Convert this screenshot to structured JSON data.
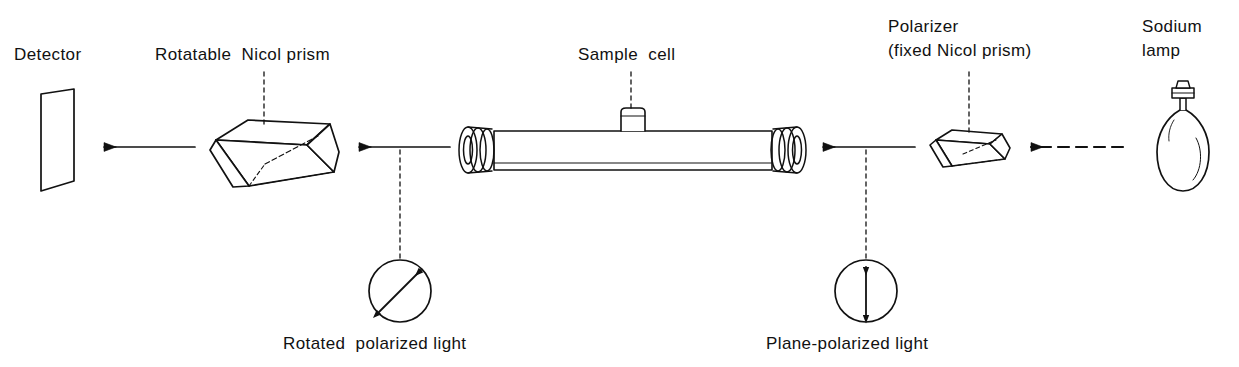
{
  "diagram": {
    "title_semantic": "polarimeter-schematic",
    "ink_color": "#111111",
    "background": "#ffffff"
  },
  "labels": {
    "detector": "Detector",
    "rotatable_prism": "Rotatable  Nicol prism",
    "sample_cell": "Sample  cell",
    "polarizer_line1": "Polarizer",
    "polarizer_line2": "(fixed Nicol prism)",
    "sodium_lamp_line1": "Sodium",
    "sodium_lamp_line2": "lamp",
    "rotated_light": "Rotated  polarized light",
    "plane_light": "Plane-polarized light"
  },
  "components": [
    {
      "name": "detector-screen",
      "kind": "parallelogram-screen",
      "x": 35,
      "y": 90
    },
    {
      "name": "rotatable-nicol-prism",
      "kind": "rhomboid-prism",
      "x": 215,
      "y": 115
    },
    {
      "name": "sample-cell",
      "kind": "tube-with-end-caps",
      "x": 460,
      "y": 120
    },
    {
      "name": "polarizer-prism",
      "kind": "flat-rhomboid-prism",
      "x": 935,
      "y": 130
    },
    {
      "name": "sodium-lamp-bulb",
      "kind": "light-bulb",
      "x": 1155,
      "y": 85
    }
  ],
  "beam_arrows": [
    {
      "name": "beam-prism-to-detector",
      "from_x": 195,
      "to_x": 103,
      "y": 147,
      "style": "solid",
      "direction": "left"
    },
    {
      "name": "beam-cell-to-prism",
      "from_x": 450,
      "to_x": 358,
      "y": 147,
      "style": "solid",
      "direction": "left"
    },
    {
      "name": "beam-polarizer-to-cell",
      "from_x": 915,
      "to_x": 822,
      "y": 147,
      "style": "solid",
      "direction": "left"
    },
    {
      "name": "beam-lamp-to-polarizer",
      "from_x": 1123,
      "to_x": 1030,
      "y": 147,
      "style": "dashed",
      "direction": "left"
    }
  ],
  "polarization_callouts": [
    {
      "name": "rotated-polarized-light",
      "cx": 400,
      "cy": 291,
      "r": 31,
      "arrow": "double-headed",
      "angle_deg": 45,
      "description": "tilted double-headed arrow"
    },
    {
      "name": "plane-polarized-light",
      "cx": 866,
      "cy": 291,
      "r": 31,
      "arrow": "double-headed",
      "angle_deg": 90,
      "description": "vertical double-headed arrow"
    }
  ],
  "leader_lines": [
    {
      "name": "leader-rotatable-prism",
      "x": 264,
      "y1": 72,
      "y2": 124
    },
    {
      "name": "leader-sample-cell",
      "x": 631,
      "y1": 72,
      "y2": 110
    },
    {
      "name": "leader-polarizer",
      "x": 969,
      "y1": 72,
      "y2": 133
    },
    {
      "name": "leader-rotated-circle",
      "x": 400,
      "y1": 150,
      "y2": 260
    },
    {
      "name": "leader-plane-circle",
      "x": 866,
      "y1": 150,
      "y2": 260
    }
  ]
}
